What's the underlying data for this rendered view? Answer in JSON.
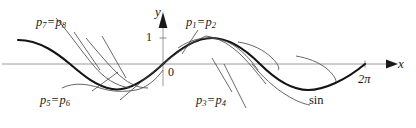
{
  "figure": {
    "background_color": "#ffffff",
    "ink_color": "#1a1a1a",
    "axis_color": "#9a9a9a",
    "curve_color": "#141414",
    "approx_color": "#4a4a4a"
  },
  "axes": {
    "x_label": "x",
    "y_label": "y",
    "origin_label": "0",
    "y_tick_label": "1",
    "x_tick_label": "2π",
    "x_axis_y": 64,
    "y_axis_x": 163,
    "x_start": 0,
    "x_end": 395,
    "y_top": 12,
    "one_level_y": 38,
    "two_pi_x": 365,
    "amplitude_px": 26
  },
  "labels": {
    "p12": {
      "lead": "p",
      "sub1": "1",
      "eq": "=",
      "lead2": "p",
      "sub2": "2"
    },
    "p34": {
      "lead": "p",
      "sub1": "3",
      "eq": "=",
      "lead2": "p",
      "sub2": "4"
    },
    "p56": {
      "lead": "p",
      "sub1": "5",
      "eq": "=",
      "lead2": "p",
      "sub2": "6"
    },
    "p78": {
      "lead": "p",
      "sub1": "7",
      "eq": "=",
      "lead2": "p",
      "sub2": "8"
    },
    "sin_label": "sin"
  },
  "curves": {
    "sine": {
      "name": "sin",
      "description": "Sine wave drawn from left of frame through origin to 2π",
      "stroke_width": 2.0
    },
    "approximations": [
      {
        "name": "approx-left-upper",
        "stroke_width": 0.8
      },
      {
        "name": "approx-left-lower",
        "stroke_width": 0.8
      },
      {
        "name": "approx-mid-trough",
        "stroke_width": 0.8
      },
      {
        "name": "approx-right-hump",
        "stroke_width": 0.8
      }
    ],
    "leader_lines": [
      {
        "name": "leader-p78",
        "from": [
          74,
          32
        ],
        "to": [
          98,
          68
        ]
      },
      {
        "name": "leader-p78b",
        "from": [
          100,
          36
        ],
        "to": [
          122,
          74
        ]
      },
      {
        "name": "leader-p56",
        "from": [
          90,
          92
        ],
        "to": [
          128,
          58
        ]
      },
      {
        "name": "leader-p12",
        "from": [
          196,
          30
        ],
        "to": [
          176,
          60
        ]
      },
      {
        "name": "leader-p34",
        "from": [
          228,
          92
        ],
        "to": [
          206,
          56
        ]
      },
      {
        "name": "leader-p34b",
        "from": [
          240,
          106
        ],
        "to": [
          214,
          62
        ]
      }
    ]
  }
}
